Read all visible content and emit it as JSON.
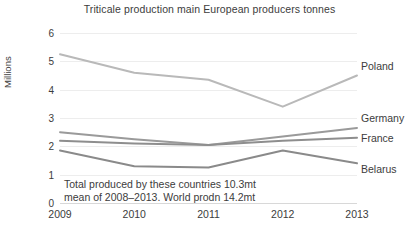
{
  "chart_data": {
    "type": "line",
    "title": "Triticale production main European producers tonnes",
    "xlabel": "",
    "ylabel": "Millions",
    "categories": [
      "2009",
      "2010",
      "2011",
      "2012",
      "2013"
    ],
    "x": [
      2009,
      2010,
      2011,
      2012,
      2013
    ],
    "ylim": [
      0,
      6
    ],
    "yticks": [
      "0",
      "1",
      "2",
      "3",
      "4",
      "5",
      "6"
    ],
    "ytick_values": [
      0,
      1,
      2,
      3,
      4,
      5,
      6
    ],
    "grid": true,
    "legend_position": "right-inline-labels",
    "series": [
      {
        "name": "Poland",
        "values": [
          5.25,
          4.6,
          4.35,
          3.4,
          4.5
        ],
        "color": "#b9b9b9"
      },
      {
        "name": "Germany",
        "values": [
          2.5,
          2.25,
          2.05,
          2.35,
          2.65
        ],
        "color": "#9a9a9a"
      },
      {
        "name": "France",
        "values": [
          2.2,
          2.1,
          2.05,
          2.2,
          2.3
        ],
        "color": "#8e8e8e"
      },
      {
        "name": "Belarus",
        "values": [
          1.85,
          1.3,
          1.25,
          1.85,
          1.4
        ],
        "color": "#8a8a8a"
      }
    ],
    "annotations": [
      "Total produced by these countries 10.3mt",
      "mean of 2008–2013. World prodn 14.2mt"
    ]
  }
}
